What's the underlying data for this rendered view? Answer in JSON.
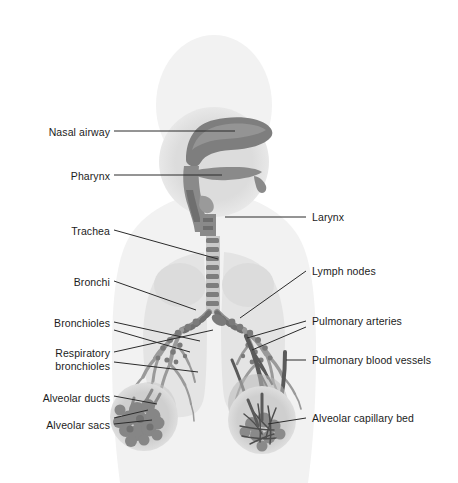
{
  "figure": {
    "background_color": "#ffffff",
    "width": 458,
    "height": 483
  },
  "palette": {
    "body_silhouette": "#f2f2f2",
    "head_inset": "#dcdcdc",
    "lung_field": "#e4e4e4",
    "airway_tissue": "#8f8f8f",
    "airway_tissue_dark": "#6f6f6f",
    "bronchial_tree": "#9a9a9a",
    "lymph_node": "#7a7a7a",
    "alveolar_sac": "#888888",
    "blood_vessel": "#5a5a5a",
    "inset_circle": "#cfcfcf",
    "leader_line": "#2b2b2b",
    "label_text": "#1c1c1c"
  },
  "labels": {
    "left": [
      {
        "id": "nasal-airway",
        "text": "Nasal airway",
        "x": 18,
        "y": 134,
        "align": "right",
        "box_width": 92
      },
      {
        "id": "pharynx",
        "text": "Pharynx",
        "x": 18,
        "y": 178,
        "align": "right",
        "box_width": 92
      },
      {
        "id": "trachea",
        "text": "Trachea",
        "x": 18,
        "y": 232,
        "align": "right",
        "box_width": 92
      },
      {
        "id": "bronchi",
        "text": "Bronchi",
        "x": 18,
        "y": 283,
        "align": "right",
        "box_width": 92
      },
      {
        "id": "bronchioles",
        "text": "Bronchioles",
        "x": 18,
        "y": 324,
        "align": "right",
        "box_width": 92
      },
      {
        "id": "respiratory-bronchioles",
        "text": "Respiratory\nbronchioles",
        "x": 18,
        "y": 353,
        "align": "right",
        "box_width": 92
      },
      {
        "id": "alveolar-ducts",
        "text": "Alveolar ducts",
        "x": 18,
        "y": 399,
        "align": "right",
        "box_width": 92
      },
      {
        "id": "alveolar-sacs",
        "text": "Alveolar sacs",
        "x": 18,
        "y": 427,
        "align": "right",
        "box_width": 92
      }
    ],
    "right": [
      {
        "id": "larynx",
        "text": "Larynx",
        "x": 312,
        "y": 220,
        "align": "left",
        "box_width": 140
      },
      {
        "id": "lymph-nodes",
        "text": "Lymph nodes",
        "x": 312,
        "y": 274,
        "align": "left",
        "box_width": 140
      },
      {
        "id": "pulmonary-arteries",
        "text": "Pulmonary arteries",
        "x": 312,
        "y": 324,
        "align": "left",
        "box_width": 140
      },
      {
        "id": "pulmonary-blood-vessels",
        "text": "Pulmonary blood vessels",
        "x": 312,
        "y": 363,
        "align": "left",
        "box_width": 145
      },
      {
        "id": "alveolar-capillary-bed",
        "text": "Alveolar capillary bed",
        "x": 312,
        "y": 421,
        "align": "left",
        "box_width": 145
      }
    ]
  },
  "leader_lines": [
    {
      "id": "leader-nasal-airway",
      "points": "114,131 235,131"
    },
    {
      "id": "leader-pharynx",
      "points": "114,175 222,175"
    },
    {
      "id": "leader-trachea",
      "points": "114,230 218,259"
    },
    {
      "id": "leader-bronchi",
      "points": "114,281 196,310"
    },
    {
      "id": "leader-bronchioles",
      "points": "114,322 200,341"
    },
    {
      "id": "leader-respiratory-bronchioles-a",
      "points": "114,352 213,330"
    },
    {
      "id": "leader-respiratory-bronchioles-b",
      "points": "114,362 198,372"
    },
    {
      "id": "leader-alveolar-ducts",
      "points": "114,396 157,404"
    },
    {
      "id": "leader-alveolar-sacs",
      "points": "114,424 150,420"
    },
    {
      "id": "leader-larynx",
      "points": "306,217 225,217"
    },
    {
      "id": "leader-lymph-nodes",
      "points": "306,271 240,318"
    },
    {
      "id": "leader-pulmonary-arteries",
      "points": "306,321 247,338"
    },
    {
      "id": "leader-pulmonary-blood-vessels",
      "points": "306,360 285,360"
    },
    {
      "id": "leader-alveolar-capillary-bed",
      "points": "306,418 268,424"
    }
  ]
}
